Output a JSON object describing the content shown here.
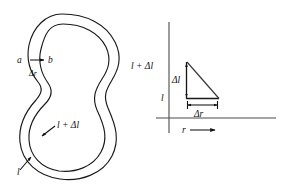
{
  "figure": {
    "panels": [
      {
        "name": "closed-curve-panel",
        "description": "Two nested closed peanut-shaped curves representing a contour of length l and an expanded contour of length l + delta l",
        "labels": {
          "point_a": "a",
          "point_b": "b",
          "delta_r": "Δr",
          "inner_curve": "l + Δl",
          "outer_curve": "l"
        }
      },
      {
        "name": "triangle-panel",
        "description": "Right triangle on r-axis showing delta l versus delta r",
        "labels": {
          "y_axis_upper_tick": "l + Δl",
          "y_axis_lower_tick": "l",
          "vertical_leg": "Δl",
          "horizontal_leg": "Δr",
          "x_axis": "r"
        }
      }
    ],
    "colors": {
      "curve_stroke": "#1a1a1a",
      "axis_stroke": "#4a4a4a",
      "background": "#ffffff",
      "label_text": "#111111"
    }
  }
}
